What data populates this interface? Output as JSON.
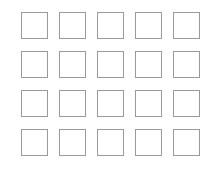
{
  "grid": {
    "rows": 4,
    "columns": 5,
    "cell_border_color": "#9a9a9a",
    "background_color": "#ffffff",
    "cells": [
      {
        "row": 1,
        "col": 1
      },
      {
        "row": 1,
        "col": 2
      },
      {
        "row": 1,
        "col": 3
      },
      {
        "row": 1,
        "col": 4
      },
      {
        "row": 1,
        "col": 5
      },
      {
        "row": 2,
        "col": 1
      },
      {
        "row": 2,
        "col": 2
      },
      {
        "row": 2,
        "col": 3
      },
      {
        "row": 2,
        "col": 4
      },
      {
        "row": 2,
        "col": 5
      },
      {
        "row": 3,
        "col": 1
      },
      {
        "row": 3,
        "col": 2
      },
      {
        "row": 3,
        "col": 3
      },
      {
        "row": 3,
        "col": 4
      },
      {
        "row": 3,
        "col": 5
      },
      {
        "row": 4,
        "col": 1
      },
      {
        "row": 4,
        "col": 2
      },
      {
        "row": 4,
        "col": 3
      },
      {
        "row": 4,
        "col": 4
      },
      {
        "row": 4,
        "col": 5
      }
    ]
  }
}
